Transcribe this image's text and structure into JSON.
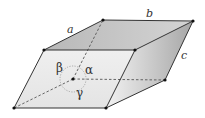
{
  "diagram": {
    "type": "unit-cell-parallelepiped",
    "labels": {
      "edge_a": "a",
      "edge_b": "b",
      "edge_c": "c",
      "angle_alpha": "α",
      "angle_beta": "β",
      "angle_gamma": "γ"
    },
    "colors": {
      "edge": "#333333",
      "hidden_edge": "#555555",
      "top_face": "#c8c8c8",
      "front_face": "#ececec",
      "side_face_light": "#e8e8e8",
      "side_face_dark": "#a8a8a8",
      "angle_circle": "#888888"
    }
  }
}
